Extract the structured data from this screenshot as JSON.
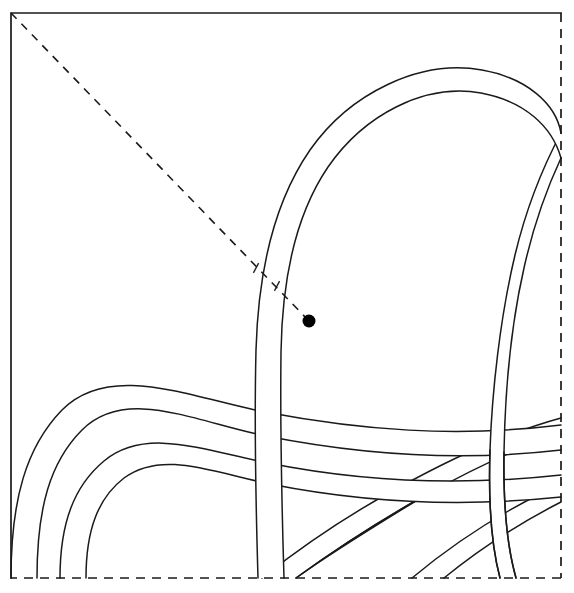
{
  "figure": {
    "kind": "geometric-line-diagram",
    "background_color": "#ffffff",
    "line_color": "#1a1a1a",
    "marker_color": "#000000",
    "canvas": {
      "width": 574,
      "height": 593
    }
  },
  "frame": {
    "left": 11,
    "top": 13,
    "right": 561,
    "bottom": 578,
    "solid_edges": [
      "top",
      "left"
    ],
    "dashed_edges": [
      "right",
      "bottom"
    ],
    "dash_pattern": "9 7",
    "stroke_width": 1.7
  },
  "diagonal_guide": {
    "label": "dashed diagonal from top-left corner to marked point",
    "x1": 11,
    "y1": 13,
    "x2": 309,
    "y2": 321,
    "dash_pattern": "8 7",
    "stroke_width": 1.6
  },
  "marker_point": {
    "label": "marked point",
    "cx": 309,
    "cy": 321,
    "r": 6.5,
    "color": "#000000"
  },
  "tick_marks": [
    {
      "label": "crossing-tick-outer",
      "cx": 256,
      "cy": 268,
      "angle_deg": 118,
      "length": 11
    },
    {
      "label": "crossing-tick-inner",
      "cx": 277,
      "cy": 286,
      "angle_deg": 118,
      "length": 11
    }
  ],
  "bands": [
    {
      "id": "band-large-arc",
      "label": "large outer arc band sweeping from top-right down to bottom-centre",
      "width_px": 26,
      "layer": 6
    },
    {
      "id": "band-right-arc",
      "label": "second arc band emerging at right edge",
      "width_px": 24,
      "layer": 5
    },
    {
      "id": "band-lower-outer",
      "label": "lower outer horizontal arc band",
      "width_px": 26,
      "layer": 4
    },
    {
      "id": "band-lower-inner",
      "label": "lower inner horizontal arc band",
      "width_px": 25,
      "layer": 3
    },
    {
      "id": "band-diagonal-a",
      "label": "diagonal band crossing bottom-right going up to the right edge",
      "width_px": 24,
      "layer": 2
    },
    {
      "id": "band-diagonal-b",
      "label": "second diagonal band in the bottom-right corner",
      "width_px": 24,
      "layer": 1
    }
  ],
  "geometry": {
    "big_arc_outer": "M 561,133 C 556,104 527,78 482,70 C 420,59 350,93 310,150 C 272,205 258,280 256,350 C 254,430 256,510 258,578",
    "big_arc_inner": "M 561,158 C 552,126 524,101 481,93 C 424,83 364,115 328,167 C 294,217 282,286 281,352 C 280,432 282,512 284,578",
    "right_arc_outer": "M 561,133 C 545,163 527,205 515,255 C 500,318 492,392 490,450 C 488,510 492,548 500,578",
    "right_arc_inner": "M 561,158 C 548,186 534,223 524,268 C 511,325 505,395 504,452 C 503,512 508,550 516,578",
    "lower_outer_top": "M 11,578 C 11,500 26,447 62,410 C 110,361 192,398 265,412 C 360,430 455,438 561,425",
    "lower_outer_bot": "M 37,578 C 37,508 50,462 82,430 C 126,386 196,422 266,436 C 362,455 458,462 561,450",
    "lower_inner_top": "M 60,578 C 60,523 74,486 104,461 C 146,426 206,451 268,463 C 358,481 452,487 561,475",
    "lower_inner_bot": "M 86,578 C 86,530 98,498 124,478 C 162,450 212,472 270,484 C 360,502 455,508 561,497",
    "diag_a_top": "M 262,578 C 300,548 346,516 398,488 C 452,458 510,432 561,418",
    "diag_a_bot": "M 296,578 C 332,552 374,524 424,496 C 478,466 528,444 561,434",
    "diag_b_top": "M 412,578 C 448,548 492,518 540,494 C 548,490 556,486 561,484",
    "diag_b_bot": "M 444,578 C 478,550 518,524 561,502"
  }
}
